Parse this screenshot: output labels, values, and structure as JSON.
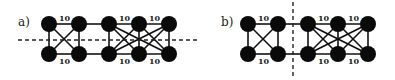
{
  "panels": [
    {
      "id": "a",
      "label": "a)",
      "cut": "horizontal",
      "weights": {
        "top": [
          "10",
          "10",
          "10"
        ],
        "bottom": [
          "10",
          "10",
          "10"
        ]
      }
    },
    {
      "id": "b",
      "label": "b)",
      "cut": "vertical",
      "weights": {
        "top": [
          "10",
          "10",
          "10"
        ],
        "bottom": [
          "10",
          "10",
          "10"
        ]
      }
    }
  ]
}
